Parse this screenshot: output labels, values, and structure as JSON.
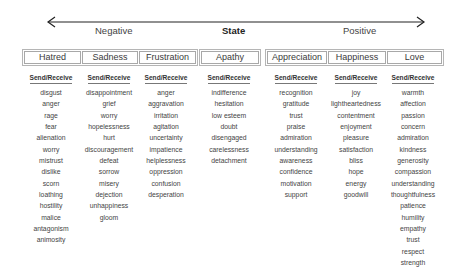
{
  "axis": {
    "title": "State",
    "negative_label": "Negative",
    "positive_label": "Positive"
  },
  "column_header": "Send/Receive",
  "states": [
    {
      "name": "Hatred",
      "valence": "negative",
      "words": [
        "disgust",
        "anger",
        "rage",
        "fear",
        "alienation",
        "worry",
        "mistrust",
        "dislike",
        "scorn",
        "loathing",
        "hostility",
        "malice",
        "antagonism",
        "animosity"
      ]
    },
    {
      "name": "Sadness",
      "valence": "negative",
      "words": [
        "disappointment",
        "grief",
        "worry",
        "hopelessness",
        "hurt",
        "discouragement",
        "defeat",
        "sorrow",
        "misery",
        "dejection",
        "unhappiness",
        "gloom"
      ]
    },
    {
      "name": "Frustration",
      "valence": "negative",
      "words": [
        "anger",
        "aggravation",
        "irritation",
        "agitation",
        "uncertainty",
        "impatience",
        "helplessness",
        "oppression",
        "confusion",
        "desperation"
      ]
    },
    {
      "name": "Apathy",
      "valence": "neutral",
      "words": [
        "indifference",
        "hesitation",
        "low esteem",
        "doubt",
        "disengaged",
        "carelessness",
        "detachment"
      ]
    },
    {
      "name": "Appreciation",
      "valence": "positive",
      "words": [
        "recognition",
        "gratitude",
        "trust",
        "praise",
        "admiration",
        "understanding",
        "awareness",
        "confidence",
        "motivation",
        "support"
      ]
    },
    {
      "name": "Happiness",
      "valence": "positive",
      "words": [
        "joy",
        "lightheartedness",
        "contentment",
        "enjoyment",
        "pleasure",
        "satisfaction",
        "bliss",
        "hope",
        "energy",
        "goodwill"
      ]
    },
    {
      "name": "Love",
      "valence": "positive",
      "words": [
        "warmth",
        "affection",
        "passion",
        "concern",
        "admiration",
        "kindness",
        "generosity",
        "compassion",
        "understanding",
        "thoughtfulness",
        "patience",
        "humility",
        "empathy",
        "trust",
        "respect",
        "strength"
      ]
    }
  ]
}
